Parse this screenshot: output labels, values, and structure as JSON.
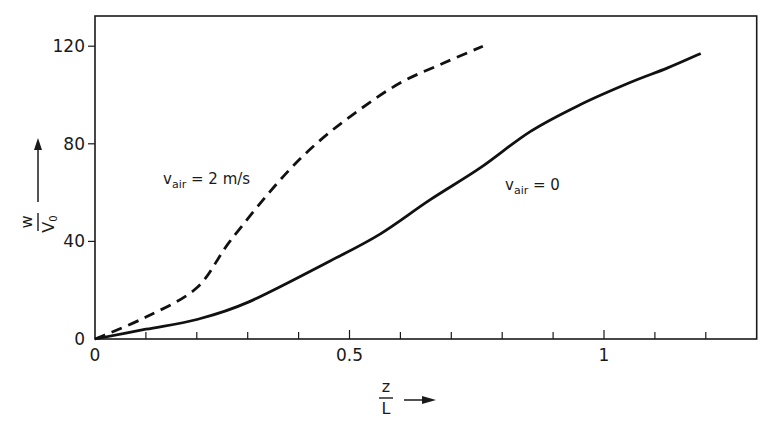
{
  "chart_data": {
    "type": "line",
    "title": "",
    "xlabel": "z / L",
    "ylabel": "w / V0",
    "xlim": [
      0,
      1.3
    ],
    "ylim": [
      0,
      130
    ],
    "x_ticks_major": [
      0,
      0.5,
      1
    ],
    "x_tick_labels": [
      "0",
      "0.5",
      "1"
    ],
    "x_ticks_minor_step": 0.1,
    "y_ticks": [
      0,
      40,
      80,
      120
    ],
    "y_tick_labels": [
      "0",
      "40",
      "80",
      "120"
    ],
    "grid": false,
    "legend": "inline labels",
    "series": [
      {
        "name": "v_air = 2 m/s",
        "style": "dashed",
        "x": [
          0,
          0.1,
          0.2,
          0.265,
          0.363,
          0.44,
          0.52,
          0.6,
          0.684,
          0.762
        ],
        "y": [
          0,
          9,
          21,
          40,
          65,
          81,
          94,
          105,
          113,
          120
        ]
      },
      {
        "name": "v_air = 0",
        "style": "solid",
        "x": [
          0,
          0.1,
          0.2,
          0.3,
          0.462,
          0.56,
          0.658,
          0.756,
          0.855,
          0.953,
          1.05,
          1.124,
          1.19
        ],
        "y": [
          0,
          4,
          8,
          15,
          32,
          43,
          57,
          70,
          85,
          96,
          105,
          111,
          117
        ]
      }
    ],
    "annotations": [
      {
        "text_main": "v",
        "text_sub": "air",
        "text_rest": " = 2 m/s",
        "series": 0
      },
      {
        "text_main": "v",
        "text_sub": "air",
        "text_rest": " = 0",
        "series": 1
      }
    ]
  },
  "axes": {
    "x_label_num": "z",
    "x_label_den": "L",
    "y_label_num": "w",
    "y_label_den": "V",
    "y_label_den_sub": "0"
  }
}
